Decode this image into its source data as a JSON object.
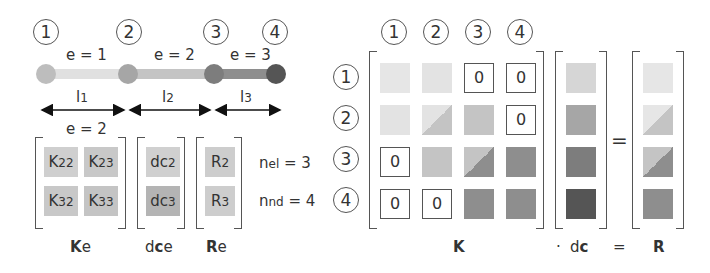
{
  "nodes": [
    {
      "label": "1",
      "color": "#bdbdbd"
    },
    {
      "label": "2",
      "color": "#a6a6a6"
    },
    {
      "label": "3",
      "color": "#7d7d7d"
    },
    {
      "label": "4",
      "color": "#555555"
    }
  ],
  "elements": [
    {
      "label": "e = 1",
      "length": "l",
      "length_sub": "1",
      "color": "#e0e0e0"
    },
    {
      "label": "e = 2",
      "length": "l",
      "length_sub": "2",
      "color": "#c4c4c4"
    },
    {
      "label": "e = 3",
      "length": "l",
      "length_sub": "3",
      "color": "#8e8e8e"
    }
  ],
  "element_matrix": {
    "title": "e = 2",
    "cells": [
      {
        "main": "K",
        "sub": "22"
      },
      {
        "main": "K",
        "sub": "23"
      },
      {
        "main": "K",
        "sub": "32"
      },
      {
        "main": "K",
        "sub": "33"
      }
    ],
    "dc": [
      {
        "main": "dc",
        "sub": "2"
      },
      {
        "main": "dc",
        "sub": "3"
      }
    ],
    "r": [
      {
        "main": "R",
        "sub": "2"
      },
      {
        "main": "R",
        "sub": "3"
      }
    ]
  },
  "counts": {
    "nel": {
      "main": "n",
      "sub": "el",
      "value": "= 3"
    },
    "nnd": {
      "main": "n",
      "sub": "nd",
      "value": "= 4"
    }
  },
  "labels": {
    "Ke": {
      "bold": "K",
      "rest": "e"
    },
    "dce": {
      "pre": "d",
      "bold": "c",
      "rest": "e"
    },
    "Re": {
      "bold": "R",
      "rest": "e"
    },
    "K": "K",
    "dot": "·",
    "dc": {
      "pre": "d",
      "bold": "c"
    },
    "eq": "=",
    "R": "R"
  },
  "global": {
    "col_headers": [
      "1",
      "2",
      "3",
      "4"
    ],
    "row_headers": [
      "1",
      "2",
      "3",
      "4"
    ],
    "zero": "0",
    "equals": "="
  }
}
